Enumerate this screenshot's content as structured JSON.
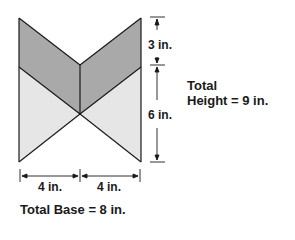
{
  "colors": {
    "dark_fill": "#a9a9a9",
    "light_fill": "#e6e6e6",
    "stroke": "#1a1a1a"
  },
  "labels": {
    "top_segment": "3 in.",
    "bottom_segment": "6 in.",
    "total_height_line1": "Total",
    "total_height_line2": "Height = 9 in.",
    "left_base": "4 in.",
    "right_base": "4 in.",
    "total_base": "Total Base = 8 in."
  },
  "figure": {
    "shape": "bow-tie composed of two rectangles split by diagonals",
    "total_base_in": 8,
    "total_height_in": 9,
    "top_band_height_in": 3,
    "bottom_band_height_in": 6,
    "half_base_in": 4
  }
}
